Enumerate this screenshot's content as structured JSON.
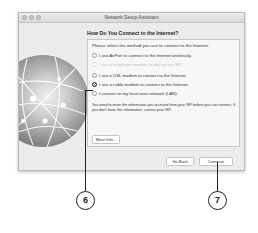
{
  "window": {
    "title": "Network Setup Assistant"
  },
  "content": {
    "heading": "How Do You Connect to the Internet?",
    "prompt": "Please select the method you use to connect to the Internet:",
    "options": [
      {
        "label": "I use AirPort to connect to the Internet wirelessly.",
        "selected": false,
        "enabled": true
      },
      {
        "label": "I use a telephone modem to dial up my ISP.",
        "selected": false,
        "enabled": false
      },
      {
        "label": "I use a DSL modem to connect to the Internet.",
        "selected": false,
        "enabled": true
      },
      {
        "label": "I use a cable modem to connect to the Internet.",
        "selected": true,
        "enabled": true
      },
      {
        "label": "I connect to my local area network (LAN).",
        "selected": false,
        "enabled": true
      }
    ],
    "note": "You need to enter the information you received from your ISP before you can connect. If you don't have this information, contact your ISP.",
    "more_info_label": "More Info..."
  },
  "footer": {
    "go_back_label": "Go Back",
    "continue_label": "Continue"
  },
  "callouts": [
    {
      "number": "6",
      "target": "cable-modem-option"
    },
    {
      "number": "7",
      "target": "continue-button"
    }
  ]
}
